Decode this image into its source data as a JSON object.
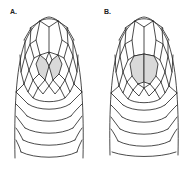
{
  "figure": {
    "panels": [
      {
        "id": "A",
        "label": "A.",
        "shaded_scales": "anterior chin shields, separated by a central wedge",
        "shade_color": "#d9d9d9"
      },
      {
        "id": "B",
        "label": "B.",
        "shaded_scales": "anterior chin shields, in contact along midline",
        "shade_color": "#d9d9d9"
      }
    ],
    "line_color": "#1e1e1e",
    "background": "#ffffff"
  }
}
